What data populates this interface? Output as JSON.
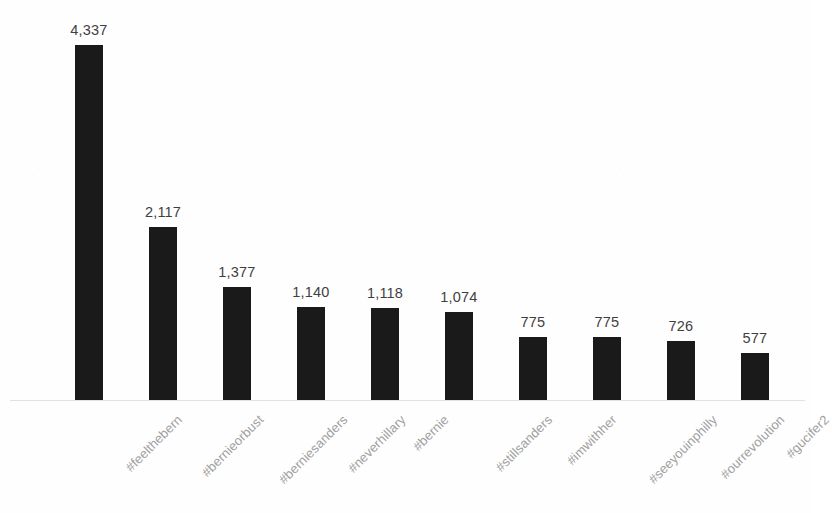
{
  "chart_data": {
    "type": "bar",
    "title": "",
    "subtitle": "",
    "xlabel": "",
    "ylabel": "",
    "grid": false,
    "legend": false,
    "orientation": "vertical",
    "ylim": [
      0,
      4337
    ],
    "categories": [
      "#feelthebern",
      "#bernieorbust",
      "#berniesanders",
      "#neverhillary",
      "#bernie",
      "#stillsanders",
      "#imwithher",
      "#seeyouinphilly",
      "#ourrevolution",
      "#gucifer2"
    ],
    "values": [
      4337,
      2117,
      1377,
      1140,
      1118,
      1074,
      775,
      775,
      726,
      577
    ],
    "value_labels": [
      "4,337",
      "2,117",
      "1,377",
      "1,140",
      "1,118",
      "1,074",
      "775",
      "775",
      "726",
      "577"
    ],
    "bar_color": "#1a1a1a",
    "label_color": "#3f3f3f",
    "category_label_color": "#a0a0a0",
    "axis_color": "#e2e2e2",
    "background_color": "#fefefe"
  }
}
